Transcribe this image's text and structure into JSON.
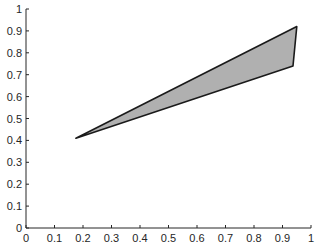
{
  "chart_data": {
    "type": "area",
    "title": "",
    "xlabel": "",
    "ylabel": "",
    "xlim": [
      0,
      1
    ],
    "ylim": [
      0,
      1
    ],
    "grid": false,
    "legend": null,
    "x_ticks": [
      "0",
      "0.1",
      "0.2",
      "0.3",
      "0.4",
      "0.5",
      "0.6",
      "0.7",
      "0.8",
      "0.9",
      "1"
    ],
    "y_ticks": [
      "0",
      "0.1",
      "0.2",
      "0.3",
      "0.4",
      "0.5",
      "0.6",
      "0.7",
      "0.8",
      "0.9",
      "1"
    ],
    "series": [
      {
        "name": "filled polygon",
        "shape": "triangle",
        "fill_color": "#b0b0b0",
        "edge_color": "#1a1a1a",
        "vertices": [
          {
            "x": 0.175,
            "y": 0.41
          },
          {
            "x": 0.95,
            "y": 0.92
          },
          {
            "x": 0.937,
            "y": 0.74
          }
        ]
      }
    ]
  }
}
